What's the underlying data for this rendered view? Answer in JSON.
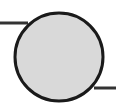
{
  "canvas": {
    "width": 116,
    "height": 112,
    "background_color": "#ffffff",
    "title": "node-with-input-and-output-connector"
  },
  "diagram": {
    "type": "schematic",
    "stroke_color": "#1a1a1a",
    "node": {
      "shape": "circle",
      "label": "",
      "fill_color": "#d9d9d9",
      "stroke_color": "#1a1a1a",
      "stroke_width": 3,
      "center_x": 59,
      "center_y": 57,
      "radius": 44
    },
    "connectors": [
      {
        "name": "input-connector",
        "side": "left",
        "orientation": "horizontal",
        "x_start": 0,
        "x_end": 28,
        "y": 23,
        "stroke_width": 3,
        "stroke_color": "#333333"
      },
      {
        "name": "output-connector",
        "side": "right",
        "orientation": "horizontal",
        "x_start": 94,
        "x_end": 116,
        "y": 88,
        "stroke_width": 3,
        "stroke_color": "#333333"
      }
    ]
  }
}
